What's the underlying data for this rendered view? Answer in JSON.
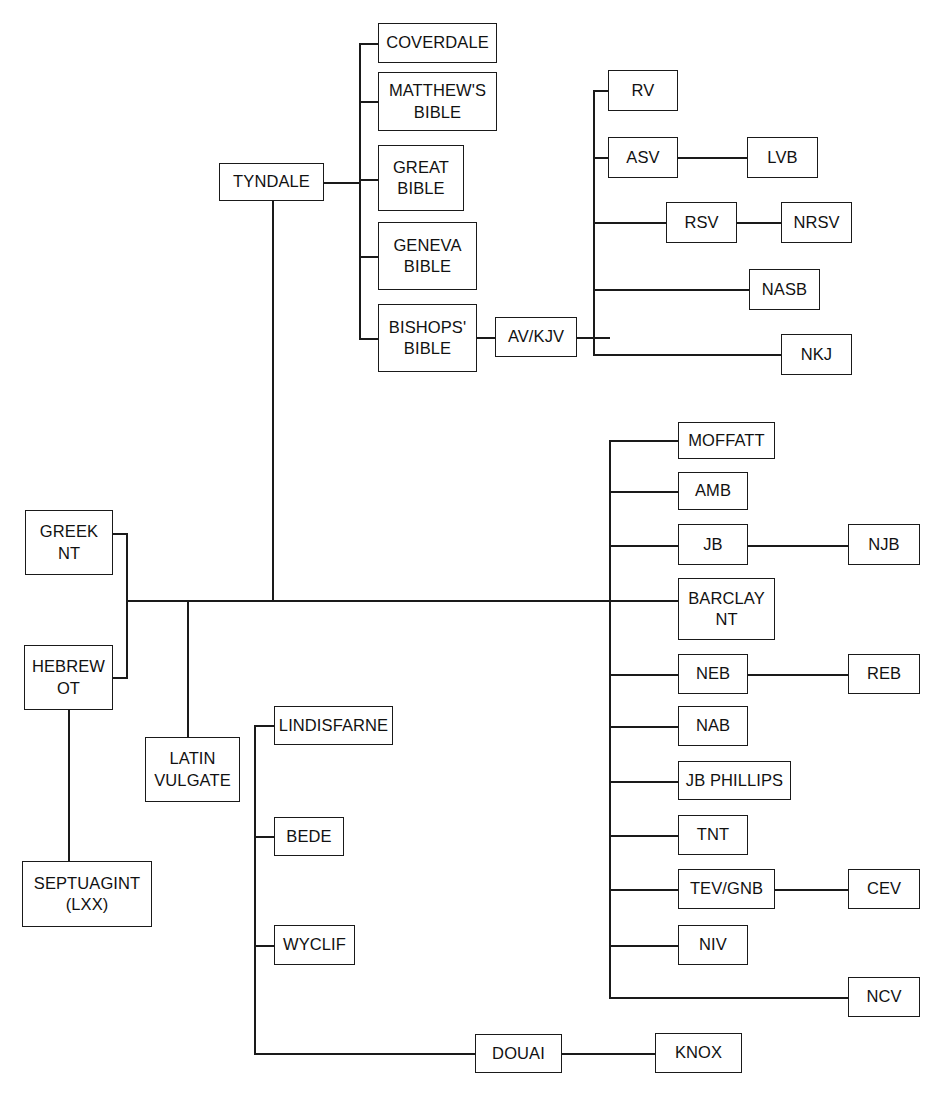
{
  "diagram": {
    "type": "tree-diagram",
    "background_color": "#ffffff",
    "line_color": "#1a1a1a",
    "text_color": "#111111",
    "nodes": [
      {
        "id": "coverdale",
        "label": "COVERDALE",
        "x": 378,
        "y": 23,
        "w": 119,
        "h": 40
      },
      {
        "id": "matthews",
        "label": "MATTHEW'S\nBIBLE",
        "x": 378,
        "y": 72,
        "w": 119,
        "h": 59
      },
      {
        "id": "great",
        "label": "GREAT\nBIBLE",
        "x": 378,
        "y": 145,
        "w": 86,
        "h": 66
      },
      {
        "id": "geneva",
        "label": "GENEVA\nBIBLE",
        "x": 378,
        "y": 222,
        "w": 99,
        "h": 68
      },
      {
        "id": "bishops",
        "label": "BISHOPS'\nBIBLE",
        "x": 378,
        "y": 304,
        "w": 99,
        "h": 68
      },
      {
        "id": "tyndale",
        "label": "TYNDALE",
        "x": 219,
        "y": 163,
        "w": 105,
        "h": 38
      },
      {
        "id": "avkjv",
        "label": "AV/KJV",
        "x": 495,
        "y": 317,
        "w": 82,
        "h": 40
      },
      {
        "id": "rv",
        "label": "RV",
        "x": 608,
        "y": 70,
        "w": 70,
        "h": 41
      },
      {
        "id": "asv",
        "label": "ASV",
        "x": 608,
        "y": 137,
        "w": 70,
        "h": 41
      },
      {
        "id": "lvb",
        "label": "LVB",
        "x": 747,
        "y": 137,
        "w": 71,
        "h": 41
      },
      {
        "id": "rsv",
        "label": "RSV",
        "x": 666,
        "y": 202,
        "w": 71,
        "h": 41
      },
      {
        "id": "nrsv",
        "label": "NRSV",
        "x": 781,
        "y": 202,
        "w": 71,
        "h": 41
      },
      {
        "id": "nasb",
        "label": "NASB",
        "x": 749,
        "y": 269,
        "w": 71,
        "h": 41
      },
      {
        "id": "nkj",
        "label": "NKJ",
        "x": 781,
        "y": 334,
        "w": 71,
        "h": 41
      },
      {
        "id": "greek_nt",
        "label": "GREEK\nNT",
        "x": 25,
        "y": 510,
        "w": 88,
        "h": 65
      },
      {
        "id": "hebrew_ot",
        "label": "HEBREW\nOT",
        "x": 24,
        "y": 645,
        "w": 89,
        "h": 65
      },
      {
        "id": "septuagint",
        "label": "SEPTUAGINT\n(LXX)",
        "x": 22,
        "y": 861,
        "w": 130,
        "h": 66
      },
      {
        "id": "latin_vulgate",
        "label": "LATIN\nVULGATE",
        "x": 145,
        "y": 737,
        "w": 95,
        "h": 65
      },
      {
        "id": "lindisfarne",
        "label": "LINDISFARNE",
        "x": 274,
        "y": 706,
        "w": 119,
        "h": 39
      },
      {
        "id": "bede",
        "label": "BEDE",
        "x": 274,
        "y": 817,
        "w": 70,
        "h": 39
      },
      {
        "id": "wyclif",
        "label": "WYCLIF",
        "x": 274,
        "y": 925,
        "w": 81,
        "h": 40
      },
      {
        "id": "douai",
        "label": "DOUAI",
        "x": 475,
        "y": 1034,
        "w": 87,
        "h": 39
      },
      {
        "id": "knox",
        "label": "KNOX",
        "x": 655,
        "y": 1033,
        "w": 87,
        "h": 40
      },
      {
        "id": "moffatt",
        "label": "MOFFATT",
        "x": 678,
        "y": 422,
        "w": 97,
        "h": 37
      },
      {
        "id": "amb",
        "label": "AMB",
        "x": 678,
        "y": 472,
        "w": 70,
        "h": 38
      },
      {
        "id": "jb",
        "label": "JB",
        "x": 678,
        "y": 524,
        "w": 70,
        "h": 41
      },
      {
        "id": "njb",
        "label": "NJB",
        "x": 848,
        "y": 524,
        "w": 72,
        "h": 41
      },
      {
        "id": "barclay",
        "label": "BARCLAY\nNT",
        "x": 678,
        "y": 578,
        "w": 97,
        "h": 62
      },
      {
        "id": "neb",
        "label": "NEB",
        "x": 678,
        "y": 654,
        "w": 70,
        "h": 40
      },
      {
        "id": "reb",
        "label": "REB",
        "x": 848,
        "y": 654,
        "w": 72,
        "h": 40
      },
      {
        "id": "nab",
        "label": "NAB",
        "x": 678,
        "y": 706,
        "w": 70,
        "h": 40
      },
      {
        "id": "jb_phillips",
        "label": "JB PHILLIPS",
        "x": 678,
        "y": 761,
        "w": 113,
        "h": 39
      },
      {
        "id": "tnt",
        "label": "TNT",
        "x": 678,
        "y": 815,
        "w": 70,
        "h": 40
      },
      {
        "id": "tev_gnb",
        "label": "TEV/GNB",
        "x": 678,
        "y": 869,
        "w": 97,
        "h": 40
      },
      {
        "id": "cev",
        "label": "CEV",
        "x": 848,
        "y": 869,
        "w": 72,
        "h": 40
      },
      {
        "id": "niv",
        "label": "NIV",
        "x": 678,
        "y": 925,
        "w": 70,
        "h": 40
      },
      {
        "id": "ncv",
        "label": "NCV",
        "x": 848,
        "y": 977,
        "w": 72,
        "h": 40
      }
    ],
    "edges": [
      {
        "id": "tyndale-bus-h",
        "kind": "h",
        "x": 324,
        "y": 182,
        "len": 37
      },
      {
        "id": "tyndale-bus-v",
        "kind": "v",
        "x": 359,
        "y": 43,
        "len": 295
      },
      {
        "id": "tyndale-coverdale",
        "kind": "h",
        "x": 359,
        "y": 43,
        "len": 20
      },
      {
        "id": "tyndale-matthews",
        "kind": "h",
        "x": 359,
        "y": 101,
        "len": 20
      },
      {
        "id": "tyndale-great",
        "kind": "h",
        "x": 359,
        "y": 179,
        "len": 20
      },
      {
        "id": "tyndale-geneva",
        "kind": "h",
        "x": 359,
        "y": 256,
        "len": 20
      },
      {
        "id": "tyndale-bishops",
        "kind": "h",
        "x": 359,
        "y": 338,
        "len": 20
      },
      {
        "id": "bishops-avkjv",
        "kind": "h",
        "x": 477,
        "y": 337,
        "len": 19
      },
      {
        "id": "avkjv-out",
        "kind": "h",
        "x": 577,
        "y": 337,
        "len": 33
      },
      {
        "id": "avkjv-bus-v",
        "kind": "v",
        "x": 593,
        "y": 90,
        "len": 265
      },
      {
        "id": "avkjv-rv",
        "kind": "h",
        "x": 593,
        "y": 90,
        "len": 16
      },
      {
        "id": "avkjv-asv",
        "kind": "h",
        "x": 593,
        "y": 157,
        "len": 16
      },
      {
        "id": "asv-lvb",
        "kind": "h",
        "x": 678,
        "y": 157,
        "len": 70
      },
      {
        "id": "avkjv-rsv",
        "kind": "h",
        "x": 593,
        "y": 222,
        "len": 74
      },
      {
        "id": "rsv-nrsv",
        "kind": "h",
        "x": 737,
        "y": 222,
        "len": 45
      },
      {
        "id": "avkjv-nasb",
        "kind": "h",
        "x": 593,
        "y": 289,
        "len": 157
      },
      {
        "id": "avkjv-nkj",
        "kind": "h",
        "x": 593,
        "y": 354,
        "len": 189
      },
      {
        "id": "greek-out-h",
        "kind": "h",
        "x": 113,
        "y": 533,
        "len": 15
      },
      {
        "id": "greek-drop-v",
        "kind": "v",
        "x": 126,
        "y": 533,
        "len": 145
      },
      {
        "id": "hebrew-out-h",
        "kind": "h",
        "x": 113,
        "y": 677,
        "len": 15
      },
      {
        "id": "origin-merge-v",
        "kind": "v",
        "x": 126,
        "y": 600,
        "len": 78
      },
      {
        "id": "hebrew-septuagint-v",
        "kind": "v",
        "x": 68,
        "y": 710,
        "len": 152
      },
      {
        "id": "main-trunk-h",
        "kind": "h",
        "x": 126,
        "y": 600,
        "len": 485
      },
      {
        "id": "tyndale-down-v",
        "kind": "v",
        "x": 272,
        "y": 201,
        "len": 400
      },
      {
        "id": "vulgate-drop-v",
        "kind": "v",
        "x": 187,
        "y": 600,
        "len": 138
      },
      {
        "id": "vulgate-wyclif-bus-v",
        "kind": "v",
        "x": 254,
        "y": 725,
        "len": 329
      },
      {
        "id": "vulgate-join-h",
        "kind": "h",
        "x": 254,
        "y": 725,
        "len": 21
      },
      {
        "id": "bus-bede",
        "kind": "h",
        "x": 254,
        "y": 836,
        "len": 21
      },
      {
        "id": "bus-wyclif",
        "kind": "h",
        "x": 254,
        "y": 945,
        "len": 21
      },
      {
        "id": "bus-douai-h",
        "kind": "h",
        "x": 254,
        "y": 1053,
        "len": 222
      },
      {
        "id": "douai-knox",
        "kind": "h",
        "x": 562,
        "y": 1053,
        "len": 94
      },
      {
        "id": "modern-bus-v",
        "kind": "v",
        "x": 609,
        "y": 440,
        "len": 557
      },
      {
        "id": "modern-moffatt",
        "kind": "h",
        "x": 609,
        "y": 440,
        "len": 70
      },
      {
        "id": "modern-amb",
        "kind": "h",
        "x": 609,
        "y": 491,
        "len": 70
      },
      {
        "id": "modern-jb",
        "kind": "h",
        "x": 609,
        "y": 545,
        "len": 70
      },
      {
        "id": "jb-njb",
        "kind": "h",
        "x": 748,
        "y": 545,
        "len": 101
      },
      {
        "id": "modern-barclay",
        "kind": "h",
        "x": 609,
        "y": 600,
        "len": 70
      },
      {
        "id": "modern-neb",
        "kind": "h",
        "x": 609,
        "y": 674,
        "len": 70
      },
      {
        "id": "neb-reb",
        "kind": "h",
        "x": 748,
        "y": 674,
        "len": 101
      },
      {
        "id": "modern-nab",
        "kind": "h",
        "x": 609,
        "y": 726,
        "len": 70
      },
      {
        "id": "modern-jbphillips",
        "kind": "h",
        "x": 609,
        "y": 781,
        "len": 70
      },
      {
        "id": "modern-tnt",
        "kind": "h",
        "x": 609,
        "y": 835,
        "len": 70
      },
      {
        "id": "modern-tevgnb",
        "kind": "h",
        "x": 609,
        "y": 889,
        "len": 70
      },
      {
        "id": "tevgnb-cev",
        "kind": "h",
        "x": 775,
        "y": 889,
        "len": 74
      },
      {
        "id": "modern-niv",
        "kind": "h",
        "x": 609,
        "y": 945,
        "len": 70
      },
      {
        "id": "modern-ncv",
        "kind": "h",
        "x": 609,
        "y": 997,
        "len": 240
      }
    ]
  }
}
